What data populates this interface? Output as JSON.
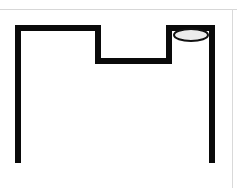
{
  "figure": {
    "canvas": {
      "width": 237,
      "height": 188,
      "background": "#ffffff"
    },
    "frame_rules": {
      "top_rule_color": "#d7d7d7",
      "right_rule_color": "#d9d9d9"
    },
    "shapes": {
      "outline": {
        "name": "notched-frame-outline",
        "description": "Thick black open outline: left vertical post, top-left horizontal arm, descending inner left wall, flat notch floor, ascending inner right wall, top-right horizontal arm, right vertical post",
        "stroke_color": "#0a0a0a",
        "stroke_width": 6,
        "points": "18,163 18,28 98,28 98,61 169,61 169,28 212,28 212,163"
      },
      "ellipse": {
        "name": "elliptical-opening",
        "description": "Light grey ellipse representing a circular opening seen in perspective at the top of the right post",
        "center_x": 191,
        "center_y": 35,
        "radius_x": 17,
        "radius_y": 6,
        "fill_color": "#ececec",
        "stroke_color": "#111111",
        "stroke_width": 2
      }
    }
  }
}
